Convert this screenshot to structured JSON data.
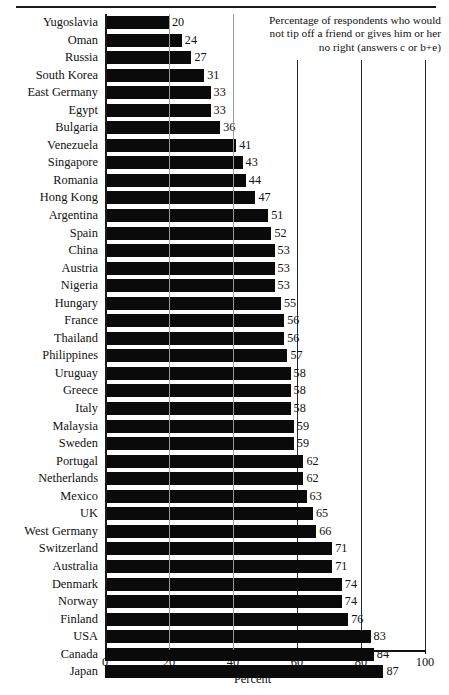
{
  "chart_data": {
    "type": "bar",
    "orientation": "horizontal",
    "title": "Percentage of respondents who would not tip off a friend or gives him or her no right (answers c or b+e)",
    "title_lines": [
      "Percentage of respondents who would",
      "not tip off a friend or gives him or her",
      "no right (answers c or b+e)"
    ],
    "xlabel": "Percent",
    "ylabel": "",
    "xlim": [
      0,
      100
    ],
    "xticks": [
      0,
      20,
      40,
      60,
      80,
      100
    ],
    "xtick_labels": [
      "0",
      "20",
      "40",
      "60",
      "80",
      "100"
    ],
    "grid": true,
    "grid_axis": "x",
    "legend": null,
    "bar_color": "#0a0a0a",
    "categories": [
      "Yugoslavia",
      "Oman",
      "Russia",
      "South Korea",
      "East Germany",
      "Egypt",
      "Bulgaria",
      "Venezuela",
      "Singapore",
      "Romania",
      "Hong Kong",
      "Argentina",
      "Spain",
      "China",
      "Austria",
      "Nigeria",
      "Hungary",
      "France",
      "Thailand",
      "Philippines",
      "Uruguay",
      "Greece",
      "Italy",
      "Malaysia",
      "Sweden",
      "Portugal",
      "Netherlands",
      "Mexico",
      "UK",
      "West Germany",
      "Switzerland",
      "Australia",
      "Denmark",
      "Norway",
      "Finland",
      "USA",
      "Canada",
      "Japan"
    ],
    "values": [
      20,
      24,
      27,
      31,
      33,
      33,
      36,
      41,
      43,
      44,
      47,
      51,
      52,
      53,
      53,
      53,
      55,
      56,
      56,
      57,
      58,
      58,
      58,
      59,
      59,
      62,
      62,
      63,
      65,
      66,
      71,
      71,
      74,
      74,
      76,
      83,
      84,
      87
    ],
    "value_labels": [
      "20",
      "24",
      "27",
      "31",
      "33",
      "33",
      "36",
      "41",
      "43",
      "44",
      "47",
      "51",
      "52",
      "53",
      "53",
      "53",
      "55",
      "56",
      "56",
      "57",
      "58",
      "58",
      "58",
      "59",
      "59",
      "62",
      "62",
      "63",
      "65",
      "66",
      "71",
      "71",
      "74",
      "74",
      "76",
      "83",
      "84",
      "87"
    ]
  }
}
